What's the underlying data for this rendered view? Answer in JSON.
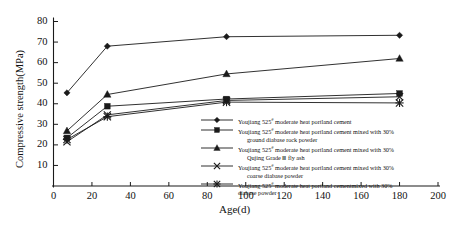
{
  "chart_data": {
    "type": "line",
    "title": "",
    "xlabel": "Age(d)",
    "ylabel": "Compressive strength(MPa)",
    "xlim": [
      0,
      200
    ],
    "ylim": [
      0,
      80
    ],
    "xticks": [
      0,
      20,
      40,
      60,
      80,
      100,
      120,
      140,
      160,
      180,
      200
    ],
    "yticks": [
      10,
      20,
      30,
      40,
      50,
      60,
      70,
      80
    ],
    "x": [
      7,
      28,
      90,
      180
    ],
    "grid": false,
    "legend_position": "inside-right",
    "series": [
      {
        "name": "Youjiang 525# moderate heat portland cement",
        "marker": "diamond",
        "values": [
          45.3,
          68.0,
          72.6,
          73.3
        ]
      },
      {
        "name": "Youjiang 525# moderate heat portland cement mixed with 30% ground diabase rock powder",
        "marker": "square",
        "values": [
          23.4,
          38.8,
          42.3,
          45.0
        ]
      },
      {
        "name": "Youjiang 525# moderate heat portland cement mixed with 30% Qujing Grade Ⅲ fly ash",
        "marker": "triangle",
        "values": [
          26.8,
          44.5,
          54.5,
          62.0
        ]
      },
      {
        "name": "Youjiang 525# moderate heat portland cement mixed with 30% coarse diabase powder",
        "marker": "x",
        "values": [
          21.5,
          34.6,
          41.6,
          43.4
        ]
      },
      {
        "name": "Youjiang 525# moderate heat portland cementmixed with 30% diabase powder",
        "marker": "asterisk",
        "values": [
          22.6,
          33.7,
          40.8,
          40.4
        ]
      }
    ]
  },
  "legend": {
    "items": [
      {
        "marker": "diamond",
        "line1_pre": "Youjiang 525",
        "line1_sup": "#",
        "line1_post": " moderate heat portland cement",
        "line2": ""
      },
      {
        "marker": "square",
        "line1_pre": "Youjiang 525",
        "line1_sup": "#",
        "line1_post": " moderate heat portland cement mixed with 30%",
        "line2": "ground diabase rock powder"
      },
      {
        "marker": "triangle",
        "line1_pre": "Youjiang 525",
        "line1_sup": "#",
        "line1_post": " moderate heat portland cement mixed with 30%",
        "line2": "Qujing Grade Ⅲ fly ash"
      },
      {
        "marker": "x",
        "line1_pre": "Youjiang 525",
        "line1_sup": "#",
        "line1_post": " moderate heat portland cement mixed with 30%",
        "line2": "coarse diabase powder"
      },
      {
        "marker": "asterisk",
        "line1_pre": "Youjiang 525",
        "line1_sup": "#",
        "line1_post": " moderate heat portland cementmixed with 30%",
        "line2": "diabase powder"
      }
    ]
  },
  "colors": {
    "ink": "#1a1a1a",
    "background": "#ffffff"
  }
}
